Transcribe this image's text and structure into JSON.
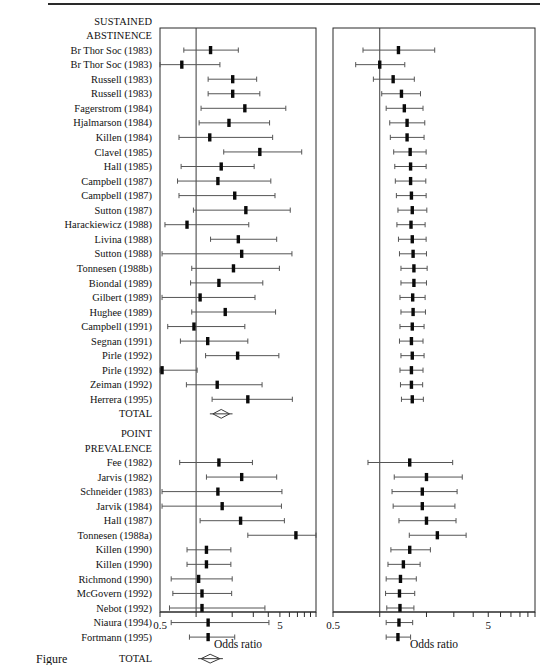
{
  "figure": {
    "caption_partial": "Figure",
    "axis_title": "Odds ratio",
    "axis_ticks": [
      "0.5",
      "5"
    ],
    "null_value": 1,
    "scale": "log"
  },
  "sections": [
    {
      "name": "sustained-abstinence",
      "header_lines": [
        "SUSTAINED",
        "ABSTINENCE"
      ],
      "total_label": "TOTAL"
    },
    {
      "name": "point-prevalence",
      "header_lines": [
        "POINT",
        "PREVALENCE"
      ],
      "total_label": "TOTAL"
    }
  ],
  "chart_data": {
    "type": "forest",
    "title": "",
    "xlabel": "Odds ratio",
    "ylabel": "",
    "xscale": "log",
    "xlim": [
      0.5,
      10
    ],
    "xticks": [
      0.5,
      1,
      2,
      3,
      4,
      5,
      6,
      7,
      8,
      9,
      10
    ],
    "xticklabels": [
      "0.5",
      "",
      "",
      "",
      "",
      "5",
      "",
      "",
      "",
      "",
      ""
    ],
    "reference_line": 1,
    "panels": [
      {
        "name": "individual-trials",
        "position": "left"
      },
      {
        "name": "cumulative-meta-analysis",
        "position": "right"
      }
    ],
    "groups": [
      {
        "label": "SUSTAINED ABSTINENCE",
        "studies": [
          {
            "label": "Br Thor Soc (1983)",
            "or": 1.32,
            "lo": 0.79,
            "hi": 2.25,
            "cum_or": 1.32,
            "cum_lo": 0.78,
            "cum_hi": 2.26
          },
          {
            "label": "Br Thor Soc (1983)",
            "or": 0.76,
            "lo": 0.5,
            "hi": 1.58,
            "cum_or": 1.0,
            "cum_lo": 0.7,
            "cum_hi": 1.45
          },
          {
            "label": "Russell (1983)",
            "or": 2.02,
            "lo": 1.26,
            "hi": 3.2,
            "cum_or": 1.22,
            "cum_lo": 0.91,
            "cum_hi": 1.67
          },
          {
            "label": "Russell (1983)",
            "or": 2.02,
            "lo": 1.26,
            "hi": 3.4,
            "cum_or": 1.38,
            "cum_lo": 1.03,
            "cum_hi": 1.83
          },
          {
            "label": "Fagerstrom (1984)",
            "or": 2.55,
            "lo": 1.1,
            "hi": 5.6,
            "cum_or": 1.44,
            "cum_lo": 1.1,
            "cum_hi": 1.9
          },
          {
            "label": "Hjalmarson (1984)",
            "or": 1.88,
            "lo": 1.06,
            "hi": 4.1,
            "cum_or": 1.5,
            "cum_lo": 1.16,
            "cum_hi": 1.95
          },
          {
            "label": "Killen (1984)",
            "or": 1.3,
            "lo": 0.72,
            "hi": 4.35,
            "cum_or": 1.5,
            "cum_lo": 1.17,
            "cum_hi": 1.93
          },
          {
            "label": "Clavel (1985)",
            "or": 3.4,
            "lo": 1.7,
            "hi": 7.6,
            "cum_or": 1.57,
            "cum_lo": 1.23,
            "cum_hi": 1.99
          },
          {
            "label": "Hall (1985)",
            "or": 1.62,
            "lo": 0.75,
            "hi": 3.05,
            "cum_or": 1.58,
            "cum_lo": 1.25,
            "cum_hi": 1.99
          },
          {
            "label": "Campbell (1987)",
            "or": 1.52,
            "lo": 0.7,
            "hi": 4.2,
            "cum_or": 1.58,
            "cum_lo": 1.26,
            "cum_hi": 1.98
          },
          {
            "label": "Campbell (1987)",
            "or": 2.1,
            "lo": 0.72,
            "hi": 4.55,
            "cum_or": 1.6,
            "cum_lo": 1.28,
            "cum_hi": 1.99
          },
          {
            "label": "Sutton (1987)",
            "or": 2.6,
            "lo": 0.95,
            "hi": 6.1,
            "cum_or": 1.62,
            "cum_lo": 1.31,
            "cum_hi": 2.01
          },
          {
            "label": "Harackiewicz (1988)",
            "or": 0.84,
            "lo": 0.55,
            "hi": 2.75,
            "cum_or": 1.59,
            "cum_lo": 1.29,
            "cum_hi": 1.96
          },
          {
            "label": "Livina (1988)",
            "or": 2.25,
            "lo": 1.32,
            "hi": 4.7,
            "cum_or": 1.62,
            "cum_lo": 1.32,
            "cum_hi": 1.99
          },
          {
            "label": "Sutton (1988)",
            "or": 2.4,
            "lo": 0.52,
            "hi": 6.3,
            "cum_or": 1.64,
            "cum_lo": 1.34,
            "cum_hi": 2.0
          },
          {
            "label": "Tonnesen (1988b)",
            "or": 2.05,
            "lo": 0.92,
            "hi": 4.95,
            "cum_or": 1.66,
            "cum_lo": 1.37,
            "cum_hi": 2.02
          },
          {
            "label": "Biondal (1989)",
            "or": 1.55,
            "lo": 0.9,
            "hi": 3.6,
            "cum_or": 1.66,
            "cum_lo": 1.37,
            "cum_hi": 2.0
          },
          {
            "label": "Gilbert (1989)",
            "or": 1.08,
            "lo": 0.52,
            "hi": 3.1,
            "cum_or": 1.63,
            "cum_lo": 1.35,
            "cum_hi": 1.96
          },
          {
            "label": "Hughee (1989)",
            "or": 1.75,
            "lo": 0.92,
            "hi": 4.6,
            "cum_or": 1.64,
            "cum_lo": 1.37,
            "cum_hi": 1.97
          },
          {
            "label": "Campbell (1991)",
            "or": 0.96,
            "lo": 0.58,
            "hi": 2.55,
            "cum_or": 1.62,
            "cum_lo": 1.35,
            "cum_hi": 1.93
          },
          {
            "label": "Segnan (1991)",
            "or": 1.25,
            "lo": 0.74,
            "hi": 2.7,
            "cum_or": 1.6,
            "cum_lo": 1.34,
            "cum_hi": 1.9
          },
          {
            "label": "Pirle (1992)",
            "or": 2.22,
            "lo": 1.2,
            "hi": 4.9,
            "cum_or": 1.62,
            "cum_lo": 1.37,
            "cum_hi": 1.93
          },
          {
            "label": "Pirle (1992)",
            "or": 0.52,
            "lo": 0.5,
            "hi": 1.02,
            "cum_or": 1.6,
            "cum_lo": 1.35,
            "cum_hi": 1.9
          },
          {
            "label": "Zeiman (1992)",
            "or": 1.5,
            "lo": 0.83,
            "hi": 3.55,
            "cum_or": 1.6,
            "cum_lo": 1.36,
            "cum_hi": 1.89
          },
          {
            "label": "Herrera (1995)",
            "or": 2.7,
            "lo": 1.36,
            "hi": 6.35,
            "cum_or": 1.62,
            "cum_lo": 1.38,
            "cum_hi": 1.91
          }
        ],
        "total": {
          "label": "TOTAL",
          "or": 1.62,
          "lo": 1.38,
          "hi": 1.9
        }
      },
      {
        "label": "POINT PREVALENCE",
        "studies": [
          {
            "label": "Schneider (1983)",
            "or": 1.56,
            "lo": 0.7,
            "hi": 3.0,
            "cum_or": 2.02,
            "cum_lo": 1.36,
            "cum_hi": 3.05
          },
          {
            "label": "Fee (1982)",
            "or": 1.55,
            "lo": 0.73,
            "hi": 2.95,
            "cum_or": 1.56,
            "cum_lo": 0.84,
            "cum_hi": 2.95
          },
          {
            "label": "Jarvis (1982)",
            "or": 2.4,
            "lo": 1.22,
            "hi": 4.7,
            "cum_or": 2.0,
            "cum_lo": 1.24,
            "cum_hi": 3.4
          },
          {
            "label": "Schneider (1983)",
            "or": 1.52,
            "lo": 0.52,
            "hi": 5.2,
            "cum_or": 1.88,
            "cum_lo": 1.2,
            "cum_hi": 3.15
          },
          {
            "label": "Jarvik (1984)",
            "or": 1.65,
            "lo": 0.52,
            "hi": 5.15,
            "cum_or": 1.88,
            "cum_lo": 1.22,
            "cum_hi": 3.05
          },
          {
            "label": "Hall (1987)",
            "or": 2.35,
            "lo": 1.08,
            "hi": 5.45,
            "cum_or": 2.0,
            "cum_lo": 1.33,
            "cum_hi": 3.1
          },
          {
            "label": "Tonnesen (1988a)",
            "or": 6.8,
            "lo": 2.7,
            "hi": 10.0,
            "cum_or": 2.35,
            "cum_lo": 1.55,
            "cum_hi": 3.6
          },
          {
            "label": "Killen (1990)",
            "or": 1.22,
            "lo": 0.84,
            "hi": 1.95,
            "cum_or": 1.56,
            "cum_lo": 1.18,
            "cum_hi": 2.12
          },
          {
            "label": "Killen (1990)",
            "or": 1.22,
            "lo": 0.84,
            "hi": 1.95,
            "cum_or": 1.42,
            "cum_lo": 1.13,
            "cum_hi": 1.82
          },
          {
            "label": "Richmond (1990)",
            "or": 1.05,
            "lo": 0.62,
            "hi": 2.0,
            "cum_or": 1.36,
            "cum_lo": 1.1,
            "cum_hi": 1.72
          },
          {
            "label": "McGovern (1992)",
            "or": 1.12,
            "lo": 0.64,
            "hi": 1.98,
            "cum_or": 1.34,
            "cum_lo": 1.09,
            "cum_hi": 1.68
          },
          {
            "label": "Nebot (1992)",
            "or": 1.12,
            "lo": 0.6,
            "hi": 3.75,
            "cum_or": 1.35,
            "cum_lo": 1.11,
            "cum_hi": 1.66
          },
          {
            "label": "Niaura (1994)",
            "or": 1.26,
            "lo": 0.62,
            "hi": 4.05,
            "cum_or": 1.33,
            "cum_lo": 1.1,
            "cum_hi": 1.63
          },
          {
            "label": "Fortmann (1995)",
            "or": 1.26,
            "lo": 0.88,
            "hi": 2.1,
            "cum_or": 1.31,
            "cum_lo": 1.1,
            "cum_hi": 1.58
          }
        ],
        "total": {
          "label": "TOTAL",
          "or": 1.31,
          "lo": 1.1,
          "hi": 1.58
        }
      }
    ]
  }
}
